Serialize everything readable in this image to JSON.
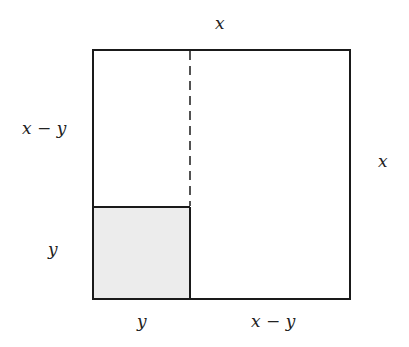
{
  "diagram": {
    "labels": {
      "top": "x",
      "right": "x",
      "left_upper": "x − y",
      "left_lower": "y",
      "bottom_left": "y",
      "bottom_right": "x − y"
    },
    "colors": {
      "stroke": "#1a1a1a",
      "shaded_fill": "#ececec",
      "background": "#ffffff"
    },
    "shapes": {
      "outer_square": {
        "x": 93,
        "y": 50,
        "w": 257,
        "h": 249
      },
      "inner_square": {
        "x": 93,
        "y": 207,
        "w": 97,
        "h": 92,
        "shaded": true
      },
      "dashed_line": {
        "x": 190,
        "y1": 50,
        "y2": 207
      }
    }
  }
}
